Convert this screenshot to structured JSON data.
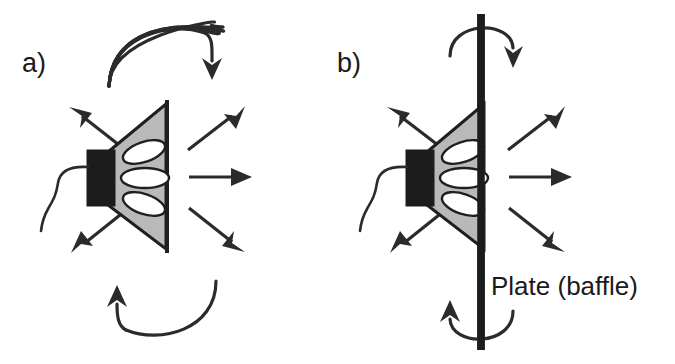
{
  "figure": {
    "background_color": "#ffffff",
    "ink_color": "#2b2b2b",
    "cone_fill_color": "#b9b9b9",
    "magnet_fill_color": "#1c1c1c",
    "hole_fill_color": "#ffffff",
    "width": 675,
    "height": 364
  },
  "panels": [
    {
      "id": "a",
      "label": "a)",
      "description": "Unbaffled loudspeaker: sound wraps around the rim of the cone",
      "has_baffle": false,
      "caption": "",
      "speaker": {
        "magnet_label": "magnet",
        "cone_label": "cone",
        "hole_count": 3,
        "wire_label": "lead wire"
      },
      "radiation_arrows": [
        {
          "name": "upper-left",
          "direction": "up-left"
        },
        {
          "name": "upper-right",
          "direction": "up-right"
        },
        {
          "name": "forward",
          "direction": "right"
        },
        {
          "name": "lower-left",
          "direction": "down-left"
        },
        {
          "name": "lower-right",
          "direction": "down-right"
        }
      ],
      "wraparound_arcs": [
        {
          "name": "top-wraparound-arc",
          "sense": "front-to-back over the top, arrowhead down"
        },
        {
          "name": "bottom-wraparound-arc",
          "sense": "front-to-back under the bottom, arrowhead up"
        }
      ]
    },
    {
      "id": "b",
      "label": "b)",
      "description": "Baffled loudspeaker: a large plate blocks the short-circuit path around the cone",
      "has_baffle": true,
      "caption": "Plate (baffle)",
      "speaker": {
        "magnet_label": "magnet",
        "cone_label": "cone",
        "hole_count": 3,
        "wire_label": "lead wire"
      },
      "radiation_arrows": [
        {
          "name": "upper-left",
          "direction": "up-left"
        },
        {
          "name": "upper-right",
          "direction": "up-right"
        },
        {
          "name": "forward",
          "direction": "right"
        },
        {
          "name": "lower-left",
          "direction": "down-left"
        },
        {
          "name": "lower-right",
          "direction": "down-right"
        }
      ],
      "wraparound_arcs": [
        {
          "name": "top-wraparound-arc",
          "sense": "around the top edge of the plate, arrowhead down"
        },
        {
          "name": "bottom-wraparound-arc",
          "sense": "around the bottom edge of the plate, arrowhead up"
        }
      ]
    }
  ]
}
